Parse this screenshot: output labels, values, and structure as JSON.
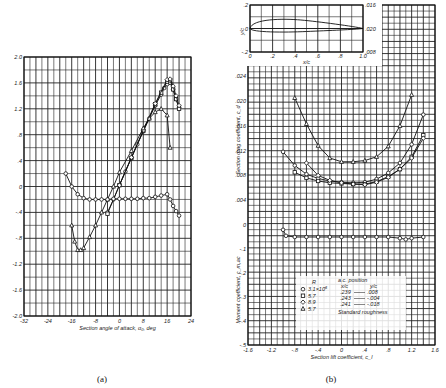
{
  "chart_data": [
    {
      "id": "a",
      "caption": "(a)",
      "type": "line",
      "title": "",
      "xlabel": "Section angle of attack, α₀, deg",
      "ylabel": "Section lift coefficient, c_l",
      "xlim": [
        -32,
        24
      ],
      "ylim": [
        -2.0,
        2.0
      ],
      "x_ticks": [
        "-32",
        "-24",
        "-16",
        "-8",
        "0",
        "8",
        "16",
        "24"
      ],
      "y_ticks": [
        "-2.0",
        "-1.6",
        "-1.2",
        "-.8",
        "-.4",
        "0",
        ".4",
        ".8",
        "1.2",
        "1.6",
        "2.0"
      ],
      "grid": true,
      "series": [
        {
          "name": "Lift, R=3.1×10⁶",
          "marker": "circle",
          "x": [
            -4,
            -2,
            0,
            2,
            4,
            6,
            8,
            10,
            12,
            14,
            15,
            16,
            17,
            18,
            19,
            20
          ],
          "y": [
            -0.4,
            -0.2,
            0.02,
            0.23,
            0.44,
            0.65,
            0.85,
            1.05,
            1.25,
            1.42,
            1.52,
            1.58,
            1.6,
            1.5,
            1.35,
            1.22
          ]
        },
        {
          "name": "Lift, R=5.7×10⁶",
          "marker": "square",
          "x": [
            -4,
            0,
            4,
            8,
            12,
            14,
            16,
            17,
            18,
            19,
            20
          ],
          "y": [
            -0.42,
            0.02,
            0.44,
            0.86,
            1.27,
            1.45,
            1.62,
            1.64,
            1.5,
            1.35,
            1.2
          ]
        },
        {
          "name": "Lift, R=8.9×10⁶",
          "marker": "diamond",
          "x": [
            0,
            4,
            8,
            12,
            16,
            17,
            18,
            19,
            20
          ],
          "y": [
            0.02,
            0.45,
            0.87,
            1.28,
            1.65,
            1.66,
            1.55,
            1.4,
            1.25
          ]
        },
        {
          "name": "Lift, standard roughness R=5.7×10⁶",
          "marker": "triangle",
          "x": [
            -16,
            -15,
            -14,
            -13,
            -12,
            -10,
            -8,
            -6,
            -4,
            -2,
            0,
            4,
            8,
            10,
            12,
            14,
            16,
            17
          ],
          "y": [
            -0.6,
            -0.85,
            -0.98,
            -0.98,
            -0.95,
            -0.78,
            -0.6,
            -0.4,
            -0.2,
            0.0,
            0.22,
            0.55,
            0.9,
            1.05,
            1.15,
            1.2,
            1.1,
            0.6
          ]
        },
        {
          "name": "Moment c_m,ac",
          "marker": "circle",
          "x": [
            -18,
            -16,
            -14,
            -12,
            -10,
            -8,
            -6,
            -4,
            -2,
            0,
            2,
            4,
            6,
            8,
            10,
            12,
            14,
            16,
            17,
            18,
            19,
            20
          ],
          "y": [
            0.2,
            0.0,
            -0.12,
            -0.18,
            -0.2,
            -0.2,
            -0.2,
            -0.2,
            -0.19,
            -0.19,
            -0.19,
            -0.19,
            -0.19,
            -0.18,
            -0.18,
            -0.16,
            -0.14,
            -0.12,
            -0.2,
            -0.3,
            -0.38,
            -0.45
          ]
        }
      ]
    },
    {
      "id": "b",
      "caption": "(b)",
      "type": "line",
      "xlabel": "Section lift coefficient, c_l",
      "ylabel_drag": "Section drag coefficient, c_d",
      "ylabel_moment": "Moment coefficient, c_m,ac",
      "xlim": [
        -1.6,
        1.6
      ],
      "x_ticks": [
        "-1.6",
        "-1.2",
        "-.8",
        "-.4",
        "0",
        ".4",
        ".8",
        "1.2",
        "1.6"
      ],
      "drag_ticks": [
        ".004",
        ".008",
        ".012",
        ".016",
        ".020",
        ".024"
      ],
      "moment_ticks": [
        "0",
        "-.1",
        "-.2",
        "-.3",
        "-.4",
        "-.5"
      ],
      "grid": true,
      "inset": {
        "xlabel": "x/c",
        "ylabel": "y/c",
        "x_ticks": [
          "0",
          ".2",
          ".4",
          ".6",
          ".8",
          "1.0"
        ],
        "y_ticks": [
          ".2",
          "0",
          "-.2"
        ],
        "right_ticks": [
          ".016",
          ".020",
          ".008"
        ]
      },
      "legend": {
        "r_header": "R",
        "entries": [
          {
            "marker": "circle",
            "label": "3.1×10⁶"
          },
          {
            "marker": "square",
            "label": "5.7"
          },
          {
            "marker": "diamond",
            "label": "8.9"
          },
          {
            "marker": "triangle",
            "label": "5.7"
          }
        ],
        "ac_header": "a.c. position",
        "ac_cols": [
          "x/c",
          "y/c"
        ],
        "ac_rows": [
          [
            ".239",
            ".008"
          ],
          [
            ".243",
            "-.004"
          ],
          [
            ".241",
            "-.018"
          ]
        ],
        "note": "Standard roughness"
      },
      "series": [
        {
          "name": "Drag, standard roughness",
          "marker": "triangle",
          "x": [
            -0.8,
            -0.6,
            -0.4,
            -0.2,
            0.0,
            0.2,
            0.4,
            0.6,
            0.8,
            1.0,
            1.2
          ],
          "y": [
            0.0205,
            0.0163,
            0.0128,
            0.0108,
            0.0102,
            0.0102,
            0.0104,
            0.011,
            0.0127,
            0.016,
            0.021
          ]
        },
        {
          "name": "Drag R=3.1×10⁶",
          "marker": "circle",
          "x": [
            -1.0,
            -0.8,
            -0.6,
            -0.4,
            -0.2,
            0.0,
            0.2,
            0.4,
            0.6,
            0.8,
            1.0,
            1.2,
            1.4
          ],
          "y": [
            0.0118,
            0.0096,
            0.0082,
            0.0075,
            0.0071,
            0.0069,
            0.0068,
            0.0069,
            0.0074,
            0.0084,
            0.01,
            0.013,
            0.0178
          ]
        },
        {
          "name": "Drag R=5.7×10⁶",
          "marker": "square",
          "x": [
            -0.8,
            -0.6,
            -0.4,
            -0.2,
            0.0,
            0.2,
            0.4,
            0.6,
            0.8,
            1.0,
            1.2,
            1.4
          ],
          "y": [
            0.0085,
            0.0076,
            0.0071,
            0.0068,
            0.0067,
            0.0066,
            0.0066,
            0.007,
            0.0078,
            0.009,
            0.011,
            0.0145
          ]
        },
        {
          "name": "Drag R=8.9×10⁶",
          "marker": "diamond",
          "x": [
            -0.6,
            -0.4,
            -0.2,
            0.0,
            0.2,
            0.4,
            0.6,
            0.8,
            1.0,
            1.2,
            1.4
          ],
          "y": [
            0.01,
            0.008,
            0.0072,
            0.0068,
            0.0066,
            0.0065,
            0.0069,
            0.0077,
            0.009,
            0.0108,
            0.014
          ]
        },
        {
          "name": "Moment c_m,ac",
          "marker": "circle",
          "x": [
            -1.0,
            -0.95,
            -0.8,
            -0.6,
            -0.4,
            -0.2,
            0.0,
            0.2,
            0.4,
            0.6,
            0.8,
            1.0,
            1.1,
            1.2,
            1.4
          ],
          "y": [
            -0.02,
            -0.045,
            -0.05,
            -0.05,
            -0.05,
            -0.05,
            -0.05,
            -0.05,
            -0.05,
            -0.05,
            -0.05,
            -0.055,
            -0.06,
            -0.055,
            -0.05
          ]
        }
      ]
    }
  ]
}
